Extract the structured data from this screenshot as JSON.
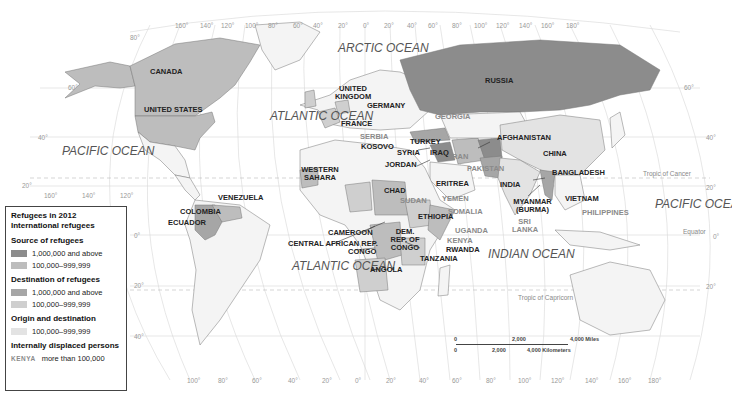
{
  "title": "Refugees in 2012",
  "colors": {
    "source_high": "#8c8c8c",
    "source_mid": "#bdbdbd",
    "dest_high": "#a6a6a6",
    "dest_mid": "#cfcfcf",
    "origin_dest": "#e3e3e3",
    "land": "#f4f4f4",
    "idp_text": "#8a8a8a",
    "grid": "#cccccc"
  },
  "legend": {
    "title": "Refugees in 2012",
    "subtitle": "International refugees",
    "source_heading": "Source of refugees",
    "source_high": "1,000,000 and above",
    "source_mid": "100,000–999,999",
    "dest_heading": "Destination of refugees",
    "dest_high": "1,000,000 and above",
    "dest_mid": "100,000–999,999",
    "origin_dest_heading": "Origin and destination",
    "origin_dest_mid": "100,000–999,999",
    "idp_heading": "Internally displaced persons",
    "idp_sample": "KENYA",
    "idp_text": "more than 100,000"
  },
  "oceans": {
    "arctic": "ARCTIC OCEAN",
    "atlantic_north": "ATLANTIC OCEAN",
    "atlantic_south": "ATLANTIC OCEAN",
    "pacific_east": "PACIFIC OCEAN",
    "pacific_west": "PACIFIC OCEAN",
    "indian": "INDIAN OCEAN"
  },
  "countries": {
    "canada": "CANADA",
    "united_states": "UNITED STATES",
    "russia": "RUSSIA",
    "united_kingdom": "UNITED KINGDOM",
    "germany": "GERMANY",
    "france": "FRANCE",
    "serbia": "SERBIA",
    "kosovo": "KOSOVO",
    "georgia": "GEORGIA",
    "turkey": "TURKEY",
    "syria": "SYRIA",
    "iraq": "IRAQ",
    "iran": "IRAN",
    "jordan": "JORDAN",
    "afghanistan": "AFGHANISTAN",
    "pakistan": "PAKISTAN",
    "china": "CHINA",
    "india": "INDIA",
    "bangladesh": "BANGLADESH",
    "myanmar": "MYANMAR (BURMA)",
    "vietnam": "VIETNAM",
    "philippines": "PHILIPPINES",
    "sri_lanka": "SRI LANKA",
    "western_sahara": "WESTERN SAHARA",
    "chad": "CHAD",
    "sudan": "SUDAN",
    "eritrea": "ERITREA",
    "yemen": "YEMEN",
    "ethiopia": "ETHIOPIA",
    "somalia": "SOMALIA",
    "uganda": "UGANDA",
    "kenya": "KENYA",
    "rwanda": "RWANDA",
    "tanzania": "TANZANIA",
    "cameroon": "CAMEROON",
    "car": "CENTRAL AFRICAN REP.",
    "congo": "CONGO",
    "drc": "DEM. REP. OF CONGO",
    "angola": "ANGOLA",
    "venezuela": "VENEZUELA",
    "colombia": "COLOMBIA",
    "ecuador": "ECUADOR"
  },
  "lines": {
    "tropic_cancer": "Tropic of Cancer",
    "equator": "Equator",
    "tropic_capricorn": "Tropic of Capricorn"
  },
  "top_ticks": [
    "160°",
    "140°",
    "120°",
    "100°",
    "80°",
    "60°",
    "40°",
    "20°",
    "0°",
    "20°",
    "40°",
    "60°",
    "80°",
    "100°",
    "120°",
    "140°",
    "160°",
    "180°"
  ],
  "bottom_ticks": [
    "100°",
    "80°",
    "60°",
    "40°",
    "20°",
    "0°",
    "20°",
    "40°",
    "60°",
    "80°",
    "100°",
    "120°",
    "140°",
    "160°",
    "180°"
  ],
  "left_ticks": [
    "80°",
    "60°",
    "40°",
    "20°",
    "160°",
    "140°",
    "120°",
    "0°",
    "20°",
    "40°"
  ],
  "right_ticks": [
    "60°",
    "40°",
    "20°",
    "0°",
    "20°"
  ],
  "scale": {
    "miles_0": "0",
    "miles_2000": "2,000",
    "miles_4000": "4,000 Miles",
    "km_0": "0",
    "km_2000": "2,000",
    "km_4000": "4,000 Kilometers"
  }
}
